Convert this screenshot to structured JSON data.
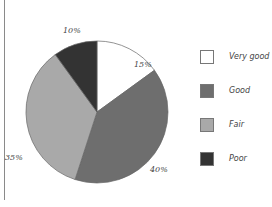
{
  "chart_data": {
    "type": "pie",
    "title": "",
    "categories": [
      "Very good",
      "Good",
      "Fair",
      "Poor"
    ],
    "values": [
      15,
      40,
      35,
      10
    ],
    "labels": [
      "15%",
      "40%",
      "35%",
      "10%"
    ],
    "colors": [
      "#ffffff",
      "#6e6e6e",
      "#a9a9a9",
      "#333333"
    ],
    "legend_position": "right",
    "start_angle": "12 o'clock, clockwise"
  },
  "legend": [
    {
      "label": "Very good",
      "color": "#ffffff"
    },
    {
      "label": "Good",
      "color": "#6e6e6e"
    },
    {
      "label": "Fair",
      "color": "#a9a9a9"
    },
    {
      "label": "Poor",
      "color": "#333333"
    }
  ],
  "slice_labels": {
    "very_good": "15%",
    "good": "40%",
    "fair": "35%",
    "poor": "10%"
  }
}
